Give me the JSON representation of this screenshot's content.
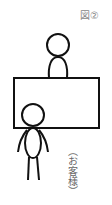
{
  "figure": {
    "label": "図②",
    "customer_label": "（お客様）"
  },
  "diagram": {
    "elements": [
      {
        "type": "person",
        "role": "staff",
        "position": "behind-table"
      },
      {
        "type": "table",
        "shape": "rectangle"
      },
      {
        "type": "person",
        "role": "customer",
        "position": "front-left-of-table"
      }
    ],
    "stroke_color": "#111111",
    "text_color": "#777777"
  }
}
